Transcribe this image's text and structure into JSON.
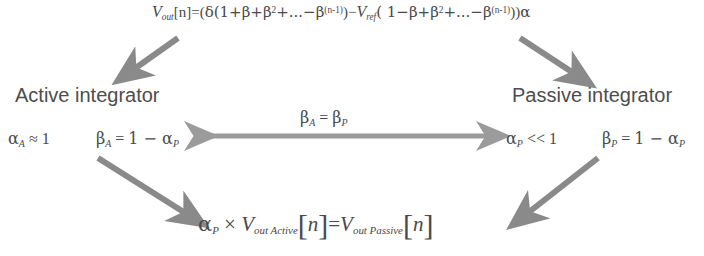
{
  "diagram": {
    "title_equation": {
      "name": "output-voltage-equation",
      "parts": {
        "v_out": "V",
        "v_out_sub": "out",
        "index": "[n]",
        "equals": "=(",
        "delta": "δ",
        "series_a": "(1+β+β",
        "series_a_sup": "2",
        "series_a_tail": "+...−β",
        "series_a_sup2": "(n-1)",
        "close_a": ")−",
        "v_ref": "V",
        "v_ref_sub": "ref",
        "open_b": "( 1−β+β",
        "series_b_sup": "2",
        "series_b_tail": "+...−β",
        "series_b_sup2": "(n-1)",
        "close_b": "))",
        "alpha": "α"
      },
      "plain_text": "V_out[n]=(δ(1+β+β2+...−β(n-1))−V_ref( 1−β+β2+...−β(n-1))α"
    },
    "left_branch": {
      "heading": "Active integrator",
      "params": [
        {
          "name": "alpha-active",
          "symbol": "α",
          "subscript": "A",
          "operator": "≈",
          "value": "1",
          "plain_text": "α_A ≈ 1"
        },
        {
          "name": "beta-active",
          "symbol": "β",
          "subscript": "A",
          "operator": "=",
          "value": "1 − α",
          "value_subscript": "P",
          "plain_text": "β_A = 1 − α_P"
        }
      ]
    },
    "right_branch": {
      "heading": "Passive integrator",
      "params": [
        {
          "name": "alpha-passive",
          "symbol": "α",
          "subscript": "P",
          "operator": "<<",
          "value": "1",
          "plain_text": "α_P << 1"
        },
        {
          "name": "beta-passive",
          "symbol": "β",
          "subscript": "P",
          "operator": "=",
          "value": "1 − α",
          "value_subscript": "P",
          "plain_text": "β_P = 1 − α_P"
        }
      ]
    },
    "middle_relation": {
      "name": "beta-equality",
      "symbol_left": "β",
      "subscript_left": "A",
      "operator": "=",
      "symbol_right": "β",
      "subscript_right": "P",
      "plain_text": "β_A = β_P"
    },
    "bottom_equation": {
      "name": "active-passive-relation",
      "alpha": "α",
      "alpha_sub": "P",
      "times": "×",
      "v_left": "V",
      "v_left_sub": "out Active",
      "bracket_open": "[",
      "n_left": "n",
      "bracket_close": "]",
      "equals": "=",
      "v_right": "V",
      "v_right_sub": "out Passive",
      "bracket_open_2": "[",
      "n_right": "n",
      "bracket_close_2": "]",
      "plain_text": "α_P × V_out Active [n] = V_out Passive [n]"
    },
    "arrows": [
      {
        "name": "arrow-top-to-active",
        "direction": "down-left",
        "color": "#8a8a8a"
      },
      {
        "name": "arrow-top-to-passive",
        "direction": "down-right",
        "color": "#8a8a8a"
      },
      {
        "name": "arrow-active-passive-bidirectional",
        "direction": "horizontal-both",
        "color": "#9b9b9b"
      },
      {
        "name": "arrow-active-to-bottom",
        "direction": "down-right",
        "color": "#8a8a8a"
      },
      {
        "name": "arrow-passive-to-bottom",
        "direction": "down-left",
        "color": "#8a8a8a"
      }
    ],
    "colors": {
      "text": "#4a4a4a",
      "heading": "#4d4d4d",
      "arrow": "#8a8a8a",
      "background": "#ffffff"
    }
  }
}
